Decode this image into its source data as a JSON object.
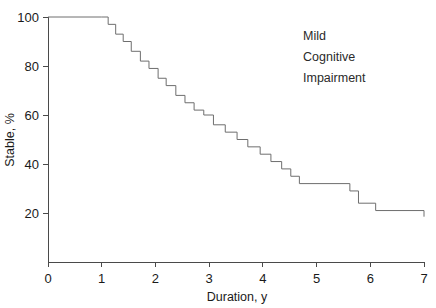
{
  "chart_data": {
    "type": "line",
    "title": "",
    "subtitle": "",
    "xlabel": "Duration, y",
    "ylabel": "Stable, %",
    "xlim": [
      0,
      7
    ],
    "ylim": [
      0,
      100
    ],
    "grid": false,
    "legend_position": "none",
    "line_style": "step-post",
    "series": [
      {
        "name": "Mild Cognitive Impairment",
        "color": "#6e6e6e",
        "x": [
          0,
          1.0,
          1.12,
          1.26,
          1.4,
          1.55,
          1.72,
          1.88,
          2.05,
          2.2,
          2.38,
          2.55,
          2.72,
          2.9,
          3.08,
          3.3,
          3.52,
          3.72,
          3.95,
          4.15,
          4.35,
          4.52,
          4.68,
          5.62,
          5.78,
          6.1,
          7.0
        ],
        "y": [
          100,
          100,
          97,
          93,
          90,
          86,
          82,
          79,
          75,
          72,
          68,
          65,
          62,
          60,
          56,
          53,
          50,
          47,
          44,
          41,
          38,
          35,
          32,
          29,
          24,
          21,
          18.5
        ]
      }
    ],
    "annotations": [
      {
        "name": "group-label",
        "lines": [
          "Mild",
          "Cognitive",
          "Impairment"
        ],
        "x": 4.6,
        "y": 88
      }
    ],
    "x_ticks": [
      {
        "value": 0,
        "label": "0"
      },
      {
        "value": 1,
        "label": "1"
      },
      {
        "value": 2,
        "label": "2"
      },
      {
        "value": 3,
        "label": "3"
      },
      {
        "value": 4,
        "label": "4"
      },
      {
        "value": 5,
        "label": "5"
      },
      {
        "value": 6,
        "label": "6"
      },
      {
        "value": 7,
        "label": "7"
      }
    ],
    "y_ticks": [
      {
        "value": 20,
        "label": "20"
      },
      {
        "value": 40,
        "label": "40"
      },
      {
        "value": 60,
        "label": "60"
      },
      {
        "value": 80,
        "label": "80"
      },
      {
        "value": 100,
        "label": "100"
      }
    ],
    "colors": {
      "axis": "#4a4a4a",
      "series": "#6e6e6e",
      "text": "#1a1a1a",
      "background": "#ffffff"
    }
  },
  "annotation": {
    "line1": "Mild",
    "line2": "Cognitive",
    "line3": "Impairment"
  },
  "axes": {
    "x_title": "Duration, y",
    "y_title": "Stable, %"
  }
}
